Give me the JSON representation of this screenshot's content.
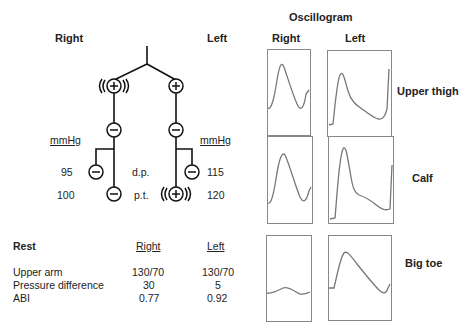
{
  "header": {
    "right_label": "Right",
    "left_label": "Left",
    "oscillogram_title": "Oscillogram",
    "osc_right": "Right",
    "osc_left": "Left"
  },
  "tree": {
    "unit_right": "mmHg",
    "unit_left": "mmHg",
    "dp_label": "d.p.",
    "pt_label": "p.t.",
    "dp_right": "95",
    "dp_left": "115",
    "pt_right": "100",
    "pt_left": "120",
    "nodes": {
      "right_upper": "+ (strong)",
      "left_upper": "+",
      "right_mid": "-",
      "left_mid": "-",
      "right_dp": "-",
      "left_dp": "-",
      "right_pt": "-",
      "left_pt": "+ (strong)"
    }
  },
  "table": {
    "title": "Rest",
    "col_right": "Right",
    "col_left": "Left",
    "rows": [
      {
        "label": "Upper arm",
        "right": "130/70",
        "left": "130/70"
      },
      {
        "label": "Pressure difference",
        "right": "30",
        "left": "5"
      },
      {
        "label": "ABI",
        "right": "0.77",
        "left": "0.92"
      }
    ]
  },
  "oscillogram": {
    "rows": [
      {
        "label": "Upper thigh"
      },
      {
        "label": "Calf"
      },
      {
        "label": "Big toe"
      }
    ]
  },
  "colors": {
    "line": "#111111",
    "waveform": "#777777",
    "box_border": "#888888"
  }
}
